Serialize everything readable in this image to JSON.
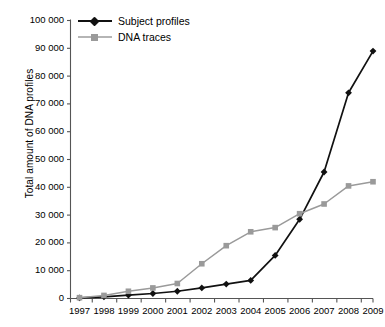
{
  "chart_data": {
    "type": "line",
    "title": "",
    "xlabel": "",
    "ylabel": "Total amount of DNA profiles",
    "categories": [
      "1997",
      "1998",
      "1999",
      "2000",
      "2001",
      "2002",
      "2003",
      "2004",
      "2005",
      "2006",
      "2007",
      "2008",
      "2009"
    ],
    "xlim": [
      1997,
      2009
    ],
    "ylim": [
      0,
      100000
    ],
    "ytick_values": [
      0,
      10000,
      20000,
      30000,
      40000,
      50000,
      60000,
      70000,
      80000,
      90000,
      100000
    ],
    "ytick_labels": [
      "0",
      "10 000",
      "20 000",
      "30 000",
      "40 000",
      "50 000",
      "60 000",
      "70 000",
      "80 000",
      "90 000",
      "100 000"
    ],
    "grid": false,
    "legend_position": "top-left",
    "series": [
      {
        "name": "Subject profiles",
        "color": "#111111",
        "marker": "diamond",
        "values": [
          200,
          600,
          1200,
          1800,
          2600,
          3800,
          5200,
          6500,
          15500,
          28500,
          45500,
          74000,
          89000
        ]
      },
      {
        "name": "DNA traces",
        "color": "#9a9a9a",
        "marker": "square",
        "values": [
          300,
          1100,
          2600,
          3800,
          5400,
          12500,
          19000,
          24000,
          25500,
          30500,
          34000,
          40500,
          42000
        ]
      }
    ]
  },
  "legend": {
    "items": [
      {
        "label": "Subject profiles",
        "marker": "diamond-marker",
        "color": "#111111"
      },
      {
        "label": "DNA traces",
        "marker": "square-marker",
        "color": "#9a9a9a"
      }
    ]
  },
  "axes": {
    "y_axis_title": "Total amount of DNA profiles",
    "axis_color": "#555555"
  }
}
